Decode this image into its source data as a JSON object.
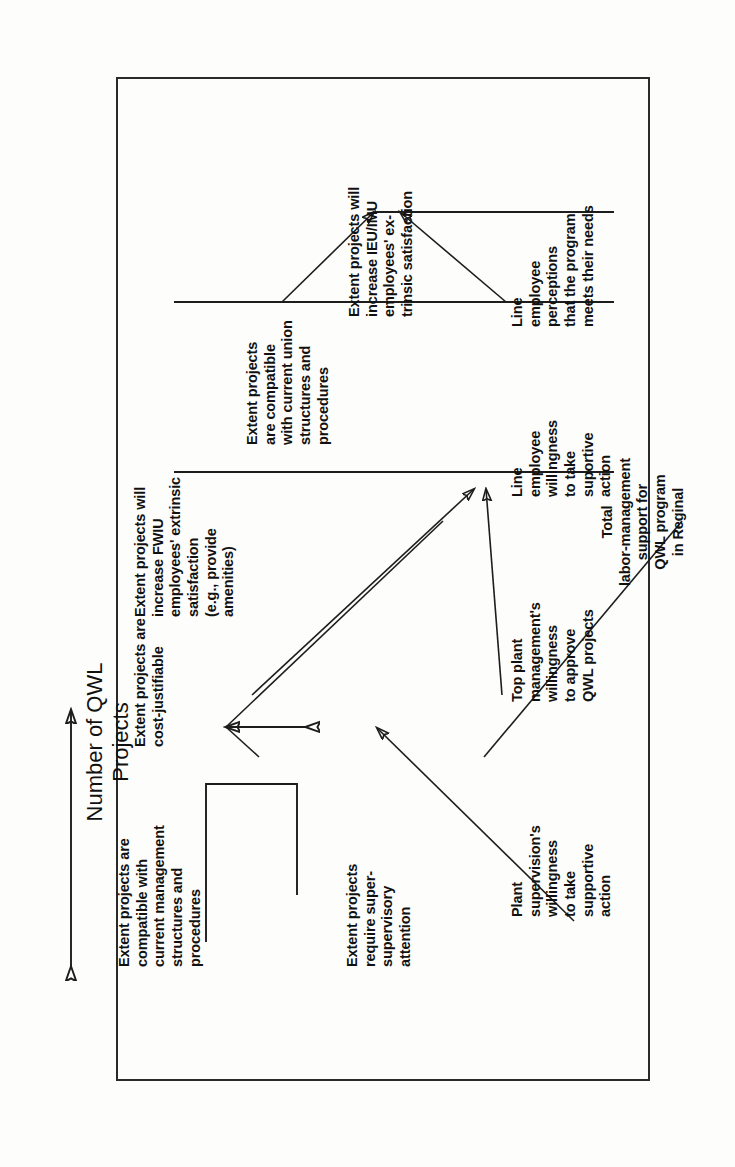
{
  "diagram": {
    "title": "Number of QWL\nProjects",
    "frame_color": "#2a2a2a",
    "line_color": "#1d1d1d",
    "text_color": "#111111",
    "orientation": "rotated-90-ccw",
    "nodes": [
      {
        "id": "cost-justifiable",
        "label": "Extent projects are\ncost-justifiable"
      },
      {
        "id": "compatible-management",
        "label": "Extent projects are\ncompatible with\ncurrent management\nstructures and\nprocedures"
      },
      {
        "id": "require-supervisory-attention",
        "label": "Extent projects\nrequire super-\nsupervisory\nattention"
      },
      {
        "id": "fwiu-extrinsic-satisfaction",
        "label": "Extent projects will\nincrease FWIU\nemployees' extrinsic\nsatisfaction\n(e.g., provide\namenities)"
      },
      {
        "id": "compatible-union",
        "label": "Extent projects\nare compatible\nwith current union\nstructures and\nprocedures"
      },
      {
        "id": "ieu-imu-extrinsic-satisfaction",
        "label": "Extent projects will\nincrease IEU/IMU\nemployees' ex-\ntrinsic satisfaction"
      },
      {
        "id": "plant-supervision-willingness",
        "label": "Plant\nsupervision's\nwillingness\nto take\nsupportive\naction"
      },
      {
        "id": "top-plant-management-willingness",
        "label": "Top plant\nmanagement's\nwillingness\nto approve\nQWL projects"
      },
      {
        "id": "line-employee-willingness",
        "label": "Line\nemployee\nwillingness\nto take\nsuportive\naction"
      },
      {
        "id": "line-employee-perceptions",
        "label": "Line\nemployee\nperceptions\nthat the program\nmeets their needs"
      },
      {
        "id": "total-labor-management-support",
        "label": "Total\nlabor-management\nsupport for\nQWL program\nin Reginal"
      }
    ]
  }
}
